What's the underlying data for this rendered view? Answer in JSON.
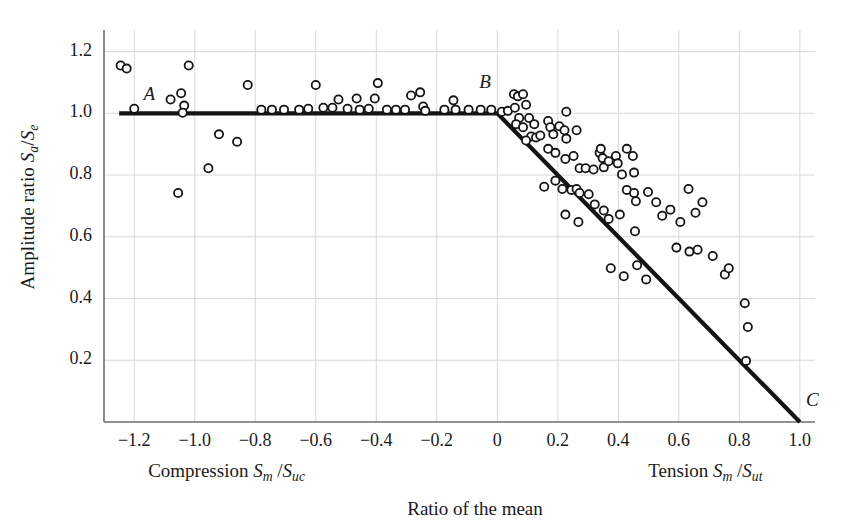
{
  "figure": {
    "background": "#ffffff",
    "ink": "#1a1a1a",
    "grid_color": "#d8d8d8",
    "axis_color": "#6e6e6e",
    "curve_color": "#141414",
    "marker_edge": "#141414"
  },
  "labels": {
    "point_a": "A",
    "point_b": "B",
    "point_c": "C",
    "y_axis_title_prefix": "Amplitude ratio ",
    "y_axis_title_num": "S",
    "y_axis_title_num_sub": "a",
    "y_axis_title_slash": "/",
    "y_axis_title_den": "S",
    "y_axis_title_den_sub": "e",
    "x_left_caption_prefix": "Compression ",
    "x_left_num": "S",
    "x_left_num_sub": "m",
    "x_left_slash": "/",
    "x_left_den": "S",
    "x_left_den_sub": "uc",
    "x_right_caption_prefix": "Tension ",
    "x_right_num": "S",
    "x_right_num_sub": "m",
    "x_right_slash": "/",
    "x_right_den": "S",
    "x_right_den_sub": "ut",
    "x_axis_title": "Ratio of the mean"
  },
  "chart_data": {
    "type": "scatter",
    "title": "",
    "xlabel": "Ratio of the mean",
    "ylabel": "Amplitude ratio Sa/Se",
    "xlim": [
      -1.3,
      1.05
    ],
    "ylim": [
      0.0,
      1.27
    ],
    "grid": true,
    "legend": "none",
    "xticks": [
      -1.2,
      -1.0,
      -0.8,
      -0.6,
      -0.4,
      -0.2,
      0,
      0.2,
      0.4,
      0.6,
      0.8,
      1.0
    ],
    "xticklabels": [
      "−1.2",
      "−1.0",
      "−0.8",
      "−0.6",
      "−0.4",
      "−0.2",
      "0",
      "0.2",
      "0.4",
      "0.6",
      "0.8",
      "1.0"
    ],
    "yticks": [
      0.2,
      0.4,
      0.6,
      0.8,
      1.0,
      1.2
    ],
    "yticklabels": [
      "0.2",
      "0.4",
      "0.6",
      "0.8",
      "1.0",
      "1.2"
    ],
    "annotations": [
      {
        "text": "A",
        "x": -1.15,
        "y": 1.055
      },
      {
        "text": "B",
        "x": -0.04,
        "y": 1.095
      },
      {
        "text": "C",
        "x": 1.04,
        "y": 0.065
      }
    ],
    "series": [
      {
        "name": "Goodman-type failure envelope",
        "type": "line",
        "style": "solid-thick",
        "color": "#141414",
        "points": [
          [
            -1.25,
            1.0
          ],
          [
            0.0,
            1.0
          ],
          [
            1.0,
            0.0
          ]
        ]
      },
      {
        "name": "Fatigue test data",
        "type": "scatter",
        "marker": "open-circle",
        "color": "#141414",
        "points": [
          [
            -1.245,
            1.155
          ],
          [
            -1.225,
            1.145
          ],
          [
            -1.2,
            1.015
          ],
          [
            -1.08,
            1.045
          ],
          [
            -1.045,
            1.065
          ],
          [
            -1.035,
            1.025
          ],
          [
            -1.04,
            1.002
          ],
          [
            -1.02,
            1.155
          ],
          [
            -1.055,
            0.742
          ],
          [
            -0.955,
            0.822
          ],
          [
            -0.92,
            0.932
          ],
          [
            -0.86,
            0.908
          ],
          [
            -0.825,
            1.092
          ],
          [
            -0.78,
            1.012
          ],
          [
            -0.745,
            1.012
          ],
          [
            -0.705,
            1.012
          ],
          [
            -0.655,
            1.012
          ],
          [
            -0.625,
            1.015
          ],
          [
            -0.6,
            1.092
          ],
          [
            -0.575,
            1.018
          ],
          [
            -0.545,
            1.018
          ],
          [
            -0.525,
            1.045
          ],
          [
            -0.495,
            1.015
          ],
          [
            -0.465,
            1.048
          ],
          [
            -0.455,
            1.012
          ],
          [
            -0.425,
            1.015
          ],
          [
            -0.405,
            1.048
          ],
          [
            -0.395,
            1.098
          ],
          [
            -0.365,
            1.012
          ],
          [
            -0.335,
            1.012
          ],
          [
            -0.305,
            1.012
          ],
          [
            -0.285,
            1.058
          ],
          [
            -0.255,
            1.068
          ],
          [
            -0.245,
            1.022
          ],
          [
            -0.238,
            1.008
          ],
          [
            -0.175,
            1.012
          ],
          [
            -0.145,
            1.042
          ],
          [
            -0.138,
            1.012
          ],
          [
            -0.095,
            1.012
          ],
          [
            -0.055,
            1.012
          ],
          [
            -0.02,
            1.012
          ],
          [
            0.015,
            1.005
          ],
          [
            0.035,
            1.008
          ],
          [
            0.055,
            1.062
          ],
          [
            0.068,
            1.055
          ],
          [
            0.085,
            1.062
          ],
          [
            0.058,
            1.018
          ],
          [
            0.072,
            0.985
          ],
          [
            0.062,
            0.965
          ],
          [
            0.085,
            0.955
          ],
          [
            0.095,
            1.028
          ],
          [
            0.105,
            0.985
          ],
          [
            0.122,
            0.965
          ],
          [
            0.112,
            0.925
          ],
          [
            0.128,
            0.922
          ],
          [
            0.142,
            0.928
          ],
          [
            0.095,
            0.912
          ],
          [
            0.168,
            0.975
          ],
          [
            0.175,
            0.955
          ],
          [
            0.185,
            0.932
          ],
          [
            0.205,
            0.958
          ],
          [
            0.222,
            0.945
          ],
          [
            0.228,
            0.918
          ],
          [
            0.228,
            1.005
          ],
          [
            0.262,
            0.945
          ],
          [
            0.168,
            0.885
          ],
          [
            0.192,
            0.872
          ],
          [
            0.225,
            0.852
          ],
          [
            0.252,
            0.862
          ],
          [
            0.272,
            0.822
          ],
          [
            0.292,
            0.822
          ],
          [
            0.318,
            0.818
          ],
          [
            0.338,
            0.872
          ],
          [
            0.352,
            0.825
          ],
          [
            0.155,
            0.762
          ],
          [
            0.192,
            0.782
          ],
          [
            0.215,
            0.755
          ],
          [
            0.245,
            0.752
          ],
          [
            0.262,
            0.755
          ],
          [
            0.272,
            0.742
          ],
          [
            0.302,
            0.738
          ],
          [
            0.342,
            0.885
          ],
          [
            0.348,
            0.855
          ],
          [
            0.368,
            0.845
          ],
          [
            0.392,
            0.862
          ],
          [
            0.398,
            0.838
          ],
          [
            0.412,
            0.802
          ],
          [
            0.428,
            0.885
          ],
          [
            0.448,
            0.862
          ],
          [
            0.452,
            0.808
          ],
          [
            0.428,
            0.752
          ],
          [
            0.452,
            0.742
          ],
          [
            0.458,
            0.715
          ],
          [
            0.225,
            0.672
          ],
          [
            0.268,
            0.648
          ],
          [
            0.322,
            0.705
          ],
          [
            0.352,
            0.685
          ],
          [
            0.368,
            0.658
          ],
          [
            0.405,
            0.672
          ],
          [
            0.455,
            0.618
          ],
          [
            0.498,
            0.745
          ],
          [
            0.525,
            0.712
          ],
          [
            0.545,
            0.668
          ],
          [
            0.572,
            0.688
          ],
          [
            0.605,
            0.648
          ],
          [
            0.632,
            0.755
          ],
          [
            0.655,
            0.678
          ],
          [
            0.678,
            0.712
          ],
          [
            0.592,
            0.565
          ],
          [
            0.635,
            0.552
          ],
          [
            0.662,
            0.558
          ],
          [
            0.712,
            0.538
          ],
          [
            0.752,
            0.478
          ],
          [
            0.765,
            0.498
          ],
          [
            0.818,
            0.385
          ],
          [
            0.828,
            0.308
          ],
          [
            0.822,
            0.198
          ],
          [
            0.375,
            0.498
          ],
          [
            0.418,
            0.472
          ],
          [
            0.462,
            0.508
          ],
          [
            0.492,
            0.462
          ]
        ]
      }
    ]
  }
}
